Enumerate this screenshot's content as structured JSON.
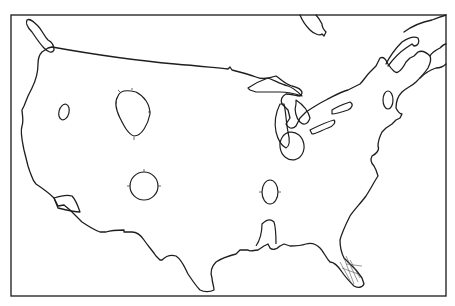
{
  "map": {
    "title": "",
    "subject": "Outline map of the contiguous United States",
    "style": "black line drawing on white",
    "colors": {
      "line": "#1e1e1e",
      "background": "#ffffff",
      "frame": "#2a2a2a"
    },
    "features": {
      "outline": "United States coastline and northern border",
      "lakes": [
        "Lake Superior",
        "Lake Michigan",
        "Lake Huron",
        "Lake Erie",
        "Lake Ontario"
      ],
      "marked_regions": [
        {
          "id": "region-nevada",
          "shape": "small oval",
          "cx": 64,
          "cy": 112
        },
        {
          "id": "region-wyoming",
          "shape": "kidney",
          "cx": 132,
          "cy": 110
        },
        {
          "id": "region-new-mexico",
          "shape": "circle",
          "cx": 144,
          "cy": 186
        },
        {
          "id": "region-michigan",
          "shape": "oval",
          "cx": 292,
          "cy": 146
        },
        {
          "id": "region-tennessee",
          "shape": "oval",
          "cx": 270,
          "cy": 194
        },
        {
          "id": "region-new-york",
          "shape": "oval",
          "cx": 388,
          "cy": 100
        },
        {
          "id": "region-mississippi-embayment",
          "shape": "lobe",
          "cx": 265,
          "cy": 240
        },
        {
          "id": "region-florida",
          "shape": "hatched peninsula",
          "cx": 350,
          "cy": 270
        },
        {
          "id": "region-gulf-baja",
          "shape": "small lobe",
          "cx": 64,
          "cy": 204
        }
      ]
    }
  }
}
